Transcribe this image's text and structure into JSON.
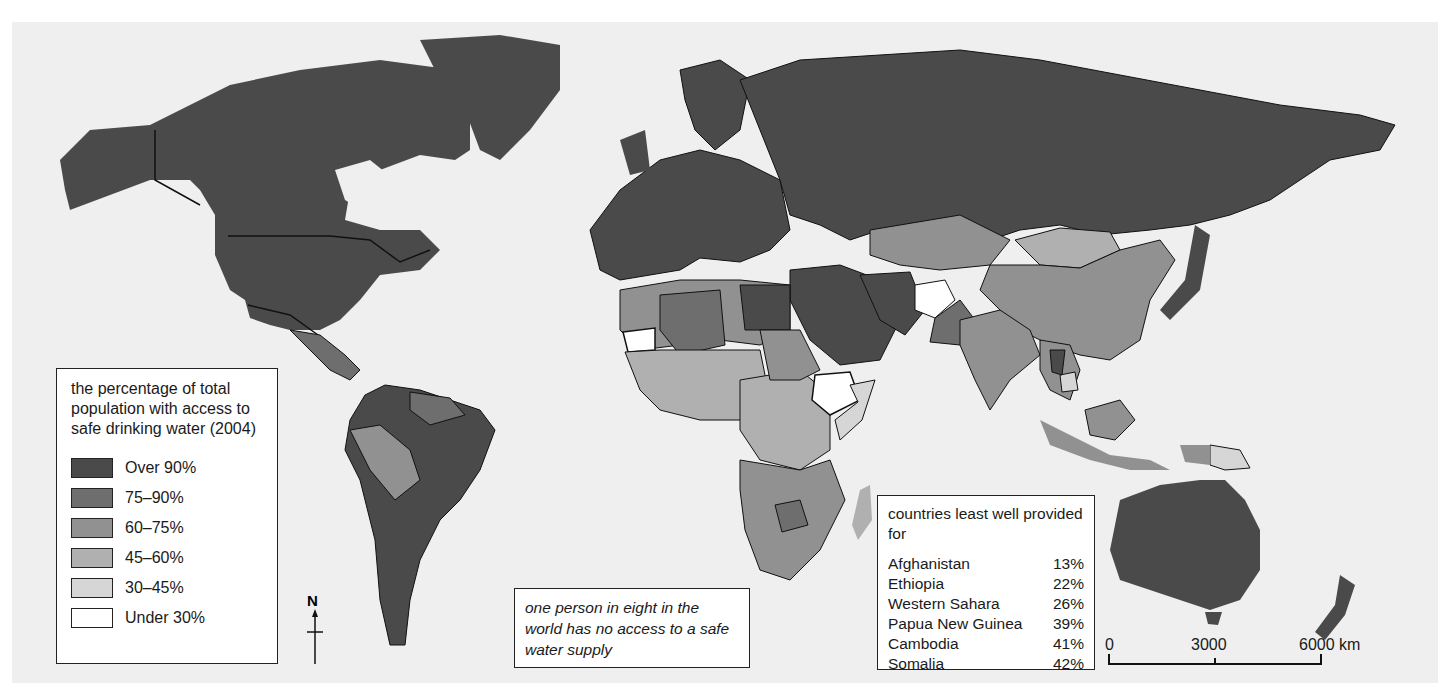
{
  "map": {
    "legend": {
      "title": "the percentage of total population with access to safe drinking water (2004)",
      "items": [
        {
          "label": "Over 90%",
          "color": "#4a4a4a"
        },
        {
          "label": "75–90%",
          "color": "#6e6e6e"
        },
        {
          "label": "60–75%",
          "color": "#919191"
        },
        {
          "label": "45–60%",
          "color": "#b0b0b0"
        },
        {
          "label": "30–45%",
          "color": "#d6d6d6"
        },
        {
          "label": "Under 30%",
          "color": "#ffffff"
        }
      ]
    },
    "callout": "one person in eight in the world has no access to a safe water supply",
    "least_provided": {
      "title": "countries least well provided for",
      "rows": [
        {
          "country": "Afghanistan",
          "value": "13%"
        },
        {
          "country": "Ethiopia",
          "value": "22%"
        },
        {
          "country": "Western Sahara",
          "value": "26%"
        },
        {
          "country": "Papua New Guinea",
          "value": "39%"
        },
        {
          "country": "Cambodia",
          "value": "41%"
        },
        {
          "country": "Somalia",
          "value": "42%"
        }
      ]
    },
    "north_label": "N",
    "scale": {
      "ticks": [
        "0",
        "3000",
        "6000 km"
      ]
    },
    "colors": {
      "ocean": "#efefef",
      "border": "#111111"
    }
  }
}
